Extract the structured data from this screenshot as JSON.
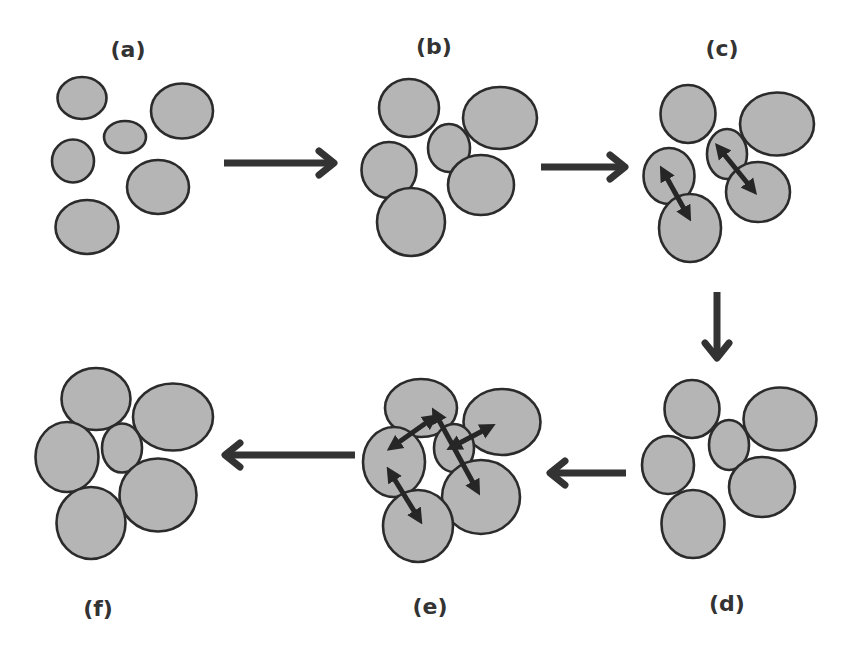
{
  "colors": {
    "particle_fill": "#b5b5b5",
    "particle_stroke": "#2b2b2b",
    "arrow": "#333333",
    "label": "#333333"
  },
  "panels": [
    {
      "id": "a",
      "label": "(a)",
      "label_pos": [
        128,
        51
      ],
      "particles": [
        {
          "cx": 82,
          "cy": 98,
          "rx": 24.5,
          "ry": 21
        },
        {
          "cx": 182,
          "cy": 111,
          "rx": 31,
          "ry": 27.5
        },
        {
          "cx": 125,
          "cy": 137,
          "rx": 21,
          "ry": 16
        },
        {
          "cx": 73,
          "cy": 161,
          "rx": 21,
          "ry": 21.5
        },
        {
          "cx": 158,
          "cy": 187,
          "rx": 31,
          "ry": 27
        },
        {
          "cx": 87,
          "cy": 227,
          "rx": 31.5,
          "ry": 27
        }
      ],
      "contact_arrows": []
    },
    {
      "id": "b",
      "label": "(b)",
      "label_pos": [
        434,
        48
      ],
      "particles": [
        {
          "cx": 409,
          "cy": 108,
          "rx": 30,
          "ry": 29
        },
        {
          "cx": 500,
          "cy": 118,
          "rx": 37,
          "ry": 31
        },
        {
          "cx": 449,
          "cy": 148,
          "rx": 21,
          "ry": 24
        },
        {
          "cx": 389,
          "cy": 170,
          "rx": 27.5,
          "ry": 28
        },
        {
          "cx": 481,
          "cy": 185,
          "rx": 33,
          "ry": 30
        },
        {
          "cx": 411,
          "cy": 222,
          "rx": 34,
          "ry": 34
        }
      ],
      "contact_arrows": []
    },
    {
      "id": "c",
      "label": "(c)",
      "label_pos": [
        722,
        50
      ],
      "particles": [
        {
          "cx": 688,
          "cy": 114,
          "rx": 27.5,
          "ry": 29
        },
        {
          "cx": 777,
          "cy": 124,
          "rx": 37,
          "ry": 31.5
        },
        {
          "cx": 727,
          "cy": 154,
          "rx": 20,
          "ry": 25
        },
        {
          "cx": 669,
          "cy": 176,
          "rx": 25.5,
          "ry": 28
        },
        {
          "cx": 758,
          "cy": 192,
          "rx": 32,
          "ry": 30
        },
        {
          "cx": 690,
          "cy": 228,
          "rx": 31,
          "ry": 34
        }
      ],
      "contact_arrows": [
        {
          "x1": 663,
          "y1": 171,
          "x2": 688,
          "y2": 216
        },
        {
          "x1": 719,
          "y1": 148,
          "x2": 753,
          "y2": 190
        }
      ]
    },
    {
      "id": "d",
      "label": "(d)",
      "label_pos": [
        727,
        605
      ],
      "particles": [
        {
          "cx": 692,
          "cy": 409,
          "rx": 27.5,
          "ry": 29
        },
        {
          "cx": 780,
          "cy": 419,
          "rx": 36.5,
          "ry": 31.5
        },
        {
          "cx": 729,
          "cy": 445,
          "rx": 20,
          "ry": 25
        },
        {
          "cx": 668,
          "cy": 465,
          "rx": 26,
          "ry": 29
        },
        {
          "cx": 762,
          "cy": 487,
          "rx": 33,
          "ry": 30
        },
        {
          "cx": 693,
          "cy": 524,
          "rx": 31.5,
          "ry": 34
        }
      ],
      "contact_arrows": []
    },
    {
      "id": "e",
      "label": "(e)",
      "label_pos": [
        430,
        608
      ],
      "particles": [
        {
          "cx": 421,
          "cy": 408,
          "rx": 36,
          "ry": 29
        },
        {
          "cx": 502,
          "cy": 422,
          "rx": 38.5,
          "ry": 33
        },
        {
          "cx": 454,
          "cy": 448,
          "rx": 20,
          "ry": 24
        },
        {
          "cx": 394,
          "cy": 462,
          "rx": 31,
          "ry": 35
        },
        {
          "cx": 481,
          "cy": 497,
          "rx": 39,
          "ry": 37
        },
        {
          "cx": 418,
          "cy": 526,
          "rx": 35,
          "ry": 36
        }
      ],
      "contact_arrows": [
        {
          "x1": 392,
          "y1": 447,
          "x2": 433,
          "y2": 418
        },
        {
          "x1": 435,
          "y1": 413,
          "x2": 477,
          "y2": 490
        },
        {
          "x1": 452,
          "y1": 447,
          "x2": 490,
          "y2": 427
        },
        {
          "x1": 390,
          "y1": 472,
          "x2": 419,
          "y2": 519
        }
      ]
    },
    {
      "id": "f",
      "label": "(f)",
      "label_pos": [
        98,
        610
      ],
      "particles": [
        {
          "cx": 96,
          "cy": 399,
          "rx": 34.5,
          "ry": 31
        },
        {
          "cx": 173,
          "cy": 417,
          "rx": 40,
          "ry": 33.5
        },
        {
          "cx": 122,
          "cy": 448,
          "rx": 20,
          "ry": 24.5
        },
        {
          "cx": 67,
          "cy": 457,
          "rx": 31.5,
          "ry": 35
        },
        {
          "cx": 158,
          "cy": 495,
          "rx": 38.5,
          "ry": 36.5
        },
        {
          "cx": 91,
          "cy": 523,
          "rx": 34.5,
          "ry": 36
        }
      ],
      "contact_arrows": []
    }
  ],
  "flow_arrows": [
    {
      "from": "a",
      "to": "b",
      "direction": "right",
      "x1": 224,
      "y1": 163,
      "x2": 334,
      "y2": 163
    },
    {
      "from": "b",
      "to": "c",
      "direction": "right",
      "x1": 541,
      "y1": 167,
      "x2": 625,
      "y2": 167
    },
    {
      "from": "c",
      "to": "d",
      "direction": "down",
      "x1": 717,
      "y1": 292,
      "x2": 717,
      "y2": 358
    },
    {
      "from": "d",
      "to": "e",
      "direction": "left",
      "x1": 626,
      "y1": 473,
      "x2": 550,
      "y2": 473
    },
    {
      "from": "e",
      "to": "f",
      "direction": "left",
      "x1": 355,
      "y1": 455,
      "x2": 225,
      "y2": 455
    }
  ]
}
